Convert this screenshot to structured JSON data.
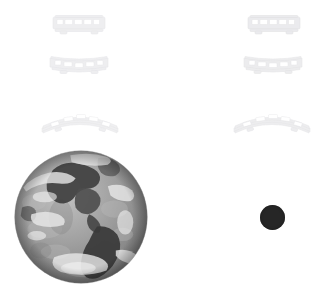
{
  "scene": {
    "title": "Earth and rail cars composition",
    "background_color": "#ffffff",
    "width": 329,
    "height": 301
  },
  "sprites": [
    {
      "name": "railcar-top-left",
      "label": "Passenger rail car",
      "kind": "railcar-straight",
      "x": 50,
      "y": 14,
      "width": 58,
      "height": 22,
      "color": "#eeeef0",
      "stroke": "#e2e2e6",
      "opacity": 0.95
    },
    {
      "name": "railcar-top-right",
      "label": "Passenger rail car",
      "kind": "railcar-straight",
      "x": 245,
      "y": 14,
      "width": 58,
      "height": 22,
      "color": "#eaeaee",
      "stroke": "#dededf",
      "opacity": 0.95
    },
    {
      "name": "railcar-second-left",
      "label": "Passenger rail car",
      "kind": "railcar-sagging",
      "x": 48,
      "y": 54,
      "width": 62,
      "height": 22,
      "color": "#eeeef0",
      "stroke": "#e3e3e6",
      "opacity": 0.95
    },
    {
      "name": "railcar-second-right",
      "label": "Passenger rail car",
      "kind": "railcar-sagging",
      "x": 242,
      "y": 54,
      "width": 62,
      "height": 22,
      "color": "#ececee",
      "stroke": "#e0e0e3",
      "opacity": 0.95
    },
    {
      "name": "railcar-curved-left",
      "label": "Curved passenger rail car",
      "kind": "railcar-arched",
      "x": 40,
      "y": 108,
      "width": 80,
      "height": 26,
      "color": "#efeff1",
      "stroke": "#e4e4e7",
      "opacity": 0.95
    },
    {
      "name": "railcar-curved-right",
      "label": "Curved passenger rail car",
      "kind": "railcar-arched",
      "x": 232,
      "y": 108,
      "width": 80,
      "height": 26,
      "color": "#ededef",
      "stroke": "#e2e2e5",
      "opacity": 0.95
    }
  ],
  "globe": {
    "name": "earth-globe",
    "label": "Earth globe showing the Americas",
    "x": 14,
    "y": 150,
    "diameter": 134,
    "ocean_color": "#9a9a9a",
    "land_color": "#4a4a4a",
    "cloud_color": "#e8e8e8",
    "highlight_color": "#c9c9c9",
    "shadow_color": "#6e6e6e"
  },
  "disc": {
    "name": "dark-disc",
    "label": "Dark sphere",
    "x": 260,
    "y": 205,
    "diameter": 25,
    "color": "#262626",
    "edge_color": "#1a1a1a"
  }
}
